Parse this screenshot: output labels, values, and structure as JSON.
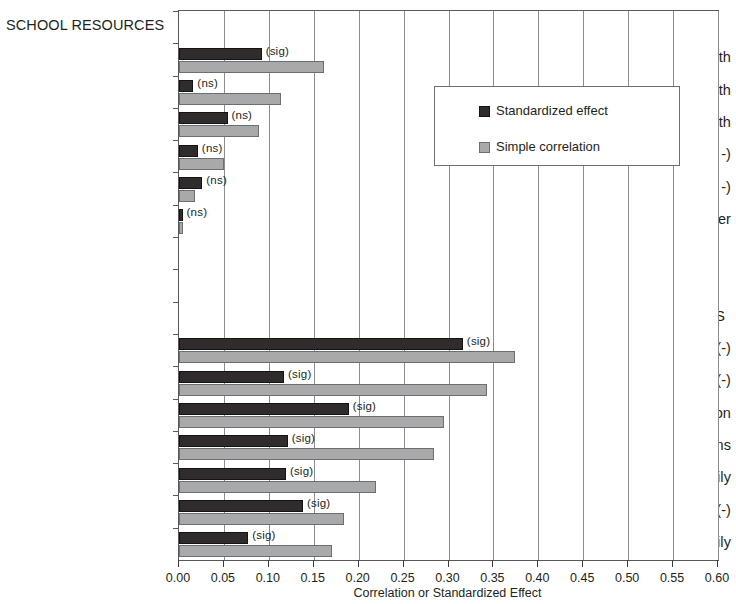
{
  "chart_data": {
    "type": "bar",
    "orientation": "horizontal",
    "title": "",
    "xlabel": "Correlation or Standardized Effect",
    "ylabel": "",
    "xlim": [
      0.0,
      0.6
    ],
    "xticks": [
      "0.00",
      "0.05",
      "0.10",
      "0.15",
      "0.20",
      "0.25",
      "0.30",
      "0.35",
      "0.40",
      "0.45",
      "0.50",
      "0.55",
      "0.60"
    ],
    "xtick_values": [
      0.0,
      0.05,
      0.1,
      0.15,
      0.2,
      0.25,
      0.3,
      0.35,
      0.4,
      0.45,
      0.5,
      0.55,
      0.6
    ],
    "grid": "vertical",
    "legend_position": "upper right inside",
    "legend": [
      {
        "name": "Standardized effect",
        "color": "#2f2c2b"
      },
      {
        "name": "Simple correlation",
        "color": "#a7a9ab"
      }
    ],
    "series": [
      {
        "name": "Standardized effect",
        "color": "#2f2c2b"
      },
      {
        "name": "Simple correlation",
        "color": "#a7a9ab"
      }
    ],
    "group_headers": [
      "SCHOOL RESOURCES",
      "FAMILY SES"
    ],
    "rows": [
      {
        "kind": "header",
        "label": "SCHOOL RESOURCES"
      },
      {
        "kind": "bar",
        "label": "Major/minor in math",
        "standardized_effect": 0.092,
        "simple_correlation": 0.161,
        "annotation": "(sig)"
      },
      {
        "kind": "bar",
        "label": "Certified for JH math",
        "standardized_effect": 0.016,
        "simple_correlation": 0.113,
        "annotation": "(ns)"
      },
      {
        "kind": "bar",
        "label": "Years teaching math",
        "standardized_effect": 0.054,
        "simple_correlation": 0.089,
        "annotation": "(ns)"
      },
      {
        "kind": "bar",
        "label": "Expenditures (corr -)",
        "standardized_effect": 0.021,
        "simple_correlation": 0.05,
        "annotation": "(ns)"
      },
      {
        "kind": "bar",
        "label": "Math class size  (std -)",
        "standardized_effect": 0.026,
        "simple_correlation": 0.018,
        "annotation": "(ns)"
      },
      {
        "kind": "bar",
        "label": "MA degree or higher",
        "standardized_effect": 0.004,
        "simple_correlation": 0.005,
        "annotation": "(ns)"
      },
      {
        "kind": "blank",
        "label": ""
      },
      {
        "kind": "blank",
        "label": ""
      },
      {
        "kind": "header",
        "label": "FAMILY SES"
      },
      {
        "kind": "bar",
        "label": "Black (-)",
        "standardized_effect": 0.316,
        "simple_correlation": 0.374,
        "annotation": "(sig)"
      },
      {
        "kind": "bar",
        "label": "Free lunch (-)",
        "standardized_effect": 0.117,
        "simple_correlation": 0.343,
        "annotation": "(sig)"
      },
      {
        "kind": "bar",
        "label": "Parent education",
        "standardized_effect": 0.189,
        "simple_correlation": 0.295,
        "annotation": "(sig)"
      },
      {
        "kind": "bar",
        "label": "Reading Items",
        "standardized_effect": 0.121,
        "simple_correlation": 0.284,
        "annotation": "(sig)"
      },
      {
        "kind": "bar",
        "label": "Two parent  family",
        "standardized_effect": 0.119,
        "simple_correlation": 0.219,
        "annotation": "(sig)"
      },
      {
        "kind": "bar",
        "label": "Hispanic (-)",
        "standardized_effect": 0.138,
        "simple_correlation": 0.184,
        "annotation": "(sig)"
      },
      {
        "kind": "bar",
        "label": "One parent  family",
        "standardized_effect": 0.077,
        "simple_correlation": 0.17,
        "annotation": "(sig)"
      }
    ]
  }
}
